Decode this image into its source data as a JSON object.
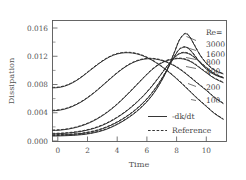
{
  "chart_data": {
    "type": "line",
    "title": "",
    "xlabel": "Time",
    "ylabel": "Dissipation",
    "xlim": [
      0,
      11.4
    ],
    "ylim": [
      -0.0006,
      0.0175
    ],
    "xticks": [
      0,
      2,
      4,
      6,
      8,
      10
    ],
    "xtick_labels": [
      "0",
      "2",
      "4",
      "6",
      "8",
      "10"
    ],
    "yticks": [
      0.0,
      0.004,
      0.008,
      0.012,
      0.016
    ],
    "ytick_labels": [
      "0.000",
      "0.004",
      "0.008",
      "0.012",
      "0.016"
    ],
    "grid": false,
    "legend_position": "lower-right-inside",
    "legend": [
      {
        "label": "-dk/dt",
        "style": "solid"
      },
      {
        "label": "Reference",
        "style": "dashed"
      }
    ],
    "series_group_title": "Re=",
    "series": [
      {
        "name": "3000",
        "style": "solid",
        "x": [
          0.0,
          0.5,
          1.0,
          1.5,
          2.0,
          2.5,
          3.0,
          3.5,
          4.0,
          4.5,
          5.0,
          5.5,
          6.0,
          6.5,
          7.0,
          7.5,
          8.0,
          8.3,
          8.6,
          8.8,
          9.0,
          9.3,
          9.7,
          10.2,
          10.7,
          11.2
        ],
        "y": [
          0.00022,
          0.00024,
          0.00028,
          0.00034,
          0.00044,
          0.0006,
          0.00085,
          0.0012,
          0.00168,
          0.00228,
          0.003,
          0.00385,
          0.0049,
          0.0062,
          0.0079,
          0.01005,
          0.0128,
          0.0145,
          0.0154,
          0.01548,
          0.015,
          0.0138,
          0.0122,
          0.0108,
          0.00995,
          0.0095
        ]
      },
      {
        "name": "1600",
        "style": "solid",
        "x": [
          0.0,
          0.5,
          1.0,
          1.5,
          2.0,
          2.5,
          3.0,
          3.5,
          4.0,
          4.5,
          5.0,
          5.5,
          6.0,
          6.5,
          7.0,
          7.5,
          8.0,
          8.3,
          8.6,
          8.8,
          9.0,
          9.3,
          9.7,
          10.2,
          10.7,
          11.2
        ],
        "y": [
          0.00035,
          0.00037,
          0.00042,
          0.0005,
          0.00062,
          0.00082,
          0.0011,
          0.0015,
          0.002,
          0.00262,
          0.00336,
          0.00424,
          0.0053,
          0.0066,
          0.0082,
          0.0101,
          0.01215,
          0.01315,
          0.0135,
          0.01345,
          0.0131,
          0.0123,
          0.0111,
          0.01,
          0.0093,
          0.0089
        ]
      },
      {
        "name": "800",
        "style": "solid",
        "x": [
          0.0,
          0.5,
          1.0,
          1.5,
          2.0,
          2.5,
          3.0,
          3.5,
          4.0,
          4.5,
          5.0,
          5.5,
          6.0,
          6.5,
          7.0,
          7.5,
          8.0,
          8.3,
          8.6,
          8.9,
          9.2,
          9.6,
          10.1,
          10.6,
          11.2
        ],
        "y": [
          0.00055,
          0.00058,
          0.00066,
          0.00078,
          0.00096,
          0.00122,
          0.00158,
          0.00206,
          0.00266,
          0.00338,
          0.00422,
          0.0052,
          0.00632,
          0.00762,
          0.00908,
          0.01062,
          0.01195,
          0.0125,
          0.01268,
          0.01255,
          0.01215,
          0.0114,
          0.0104,
          0.00955,
          0.0089
        ]
      },
      {
        "name": "400",
        "style": "solid",
        "x": [
          0.0,
          0.5,
          1.0,
          1.5,
          2.0,
          2.5,
          3.0,
          3.5,
          4.0,
          4.5,
          5.0,
          5.5,
          6.0,
          6.5,
          7.0,
          7.5,
          8.0,
          8.4,
          8.8,
          9.2,
          9.6,
          10.1,
          10.6,
          11.2
        ],
        "y": [
          0.00105,
          0.0011,
          0.00124,
          0.00148,
          0.00182,
          0.00228,
          0.00288,
          0.00362,
          0.0045,
          0.00552,
          0.00664,
          0.00782,
          0.009,
          0.0101,
          0.01095,
          0.0115,
          0.01175,
          0.0118,
          0.0116,
          0.01115,
          0.0105,
          0.00965,
          0.00885,
          0.0082
        ]
      },
      {
        "name": "200",
        "style": "solid",
        "x": [
          0.0,
          0.5,
          1.0,
          1.5,
          2.0,
          2.5,
          3.0,
          3.5,
          4.0,
          4.5,
          5.0,
          5.5,
          6.0,
          6.5,
          7.0,
          7.5,
          8.0,
          8.5,
          9.0,
          9.5,
          10.1,
          10.6,
          11.2
        ],
        "y": [
          0.004,
          0.0041,
          0.00438,
          0.00485,
          0.00548,
          0.00628,
          0.0072,
          0.0082,
          0.0092,
          0.01012,
          0.01088,
          0.01142,
          0.01172,
          0.01178,
          0.01162,
          0.01125,
          0.0107,
          0.00995,
          0.00905,
          0.0081,
          0.007,
          0.006,
          0.00505
        ]
      },
      {
        "name": "100",
        "style": "solid",
        "x": [
          0.0,
          0.4,
          0.8,
          1.2,
          1.6,
          2.0,
          2.5,
          3.0,
          3.5,
          4.0,
          4.5,
          5.0,
          5.5,
          6.0,
          6.5,
          7.0,
          7.5,
          8.0,
          8.5,
          9.0,
          9.5,
          10.1,
          10.6,
          11.2
        ],
        "y": [
          0.00742,
          0.00748,
          0.00768,
          0.00805,
          0.00856,
          0.0092,
          0.0101,
          0.01098,
          0.01175,
          0.01232,
          0.01262,
          0.01268,
          0.01252,
          0.01215,
          0.01158,
          0.01085,
          0.01,
          0.00905,
          0.008,
          0.0069,
          0.0058,
          0.0046,
          0.0036,
          0.0027
        ]
      }
    ],
    "reference_series": [
      {
        "name": "3000-ref",
        "style": "dashed"
      },
      {
        "name": "1600-ref",
        "style": "dashed"
      },
      {
        "name": "800-ref",
        "style": "dashed"
      },
      {
        "name": "400-ref",
        "style": "dashed"
      },
      {
        "name": "200-ref",
        "style": "dashed"
      },
      {
        "name": "100-ref",
        "style": "dashed"
      }
    ],
    "annotations": [
      {
        "text": "Re=",
        "x": 10.05,
        "y": 0.01565
      },
      {
        "text": "3000",
        "x": 10.05,
        "y": 0.014
      },
      {
        "text": "1600",
        "x": 10.05,
        "y": 0.01245
      },
      {
        "text": "800",
        "x": 10.05,
        "y": 0.01118
      },
      {
        "text": "400",
        "x": 10.05,
        "y": 0.00995
      },
      {
        "text": "200",
        "x": 10.05,
        "y": 0.00745
      },
      {
        "text": "100",
        "x": 10.05,
        "y": 0.0056
      }
    ]
  }
}
